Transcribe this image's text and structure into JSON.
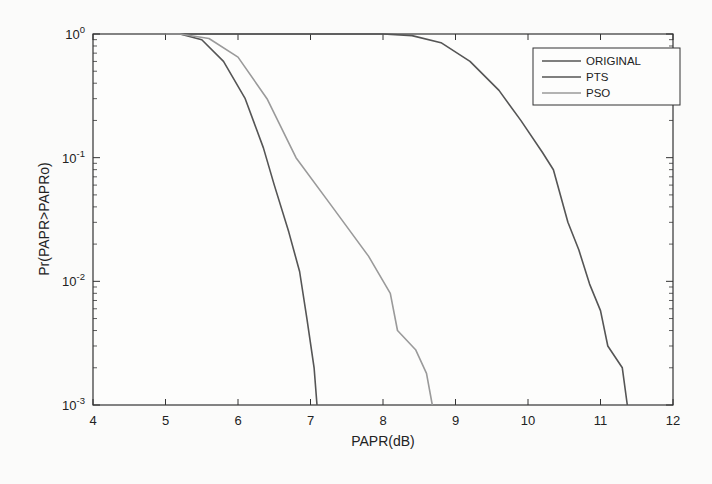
{
  "chart_data": {
    "type": "line",
    "title": "",
    "xlabel": "PAPR(dB)",
    "ylabel": "Pr(PAPR>PAPRo)",
    "xlim": [
      4,
      12
    ],
    "ylim": [
      0.001,
      1
    ],
    "yscale": "log",
    "grid": false,
    "legend_position": "upper right",
    "x_ticks": [
      "4",
      "5",
      "6",
      "7",
      "8",
      "9",
      "10",
      "11",
      "12"
    ],
    "y_ticks": [
      {
        "base": "10",
        "exp": "0"
      },
      {
        "base": "10",
        "exp": "-1"
      },
      {
        "base": "10",
        "exp": "-2"
      },
      {
        "base": "10",
        "exp": "-3"
      }
    ],
    "series": [
      {
        "name": "ORIGINAL",
        "color": "#555555",
        "x": [
          8.0,
          8.4,
          8.8,
          9.2,
          9.6,
          9.9,
          10.2,
          10.35,
          10.55,
          10.7,
          10.85,
          11.0,
          11.1,
          11.3,
          11.37
        ],
        "y": [
          1.0,
          0.97,
          0.85,
          0.6,
          0.35,
          0.2,
          0.11,
          0.08,
          0.03,
          0.018,
          0.0095,
          0.0058,
          0.003,
          0.002,
          0.001
        ]
      },
      {
        "name": "PTS",
        "color": "#555555",
        "x": [
          5.2,
          5.5,
          5.8,
          6.1,
          6.35,
          6.5,
          6.7,
          6.85,
          6.95,
          7.05,
          7.09
        ],
        "y": [
          1.0,
          0.9,
          0.6,
          0.3,
          0.12,
          0.06,
          0.025,
          0.012,
          0.005,
          0.002,
          0.001
        ]
      },
      {
        "name": "PSO",
        "color": "#9a9a9a",
        "x": [
          5.2,
          5.6,
          6.0,
          6.4,
          6.8,
          7.3,
          7.8,
          8.1,
          8.2,
          8.45,
          8.6,
          8.68
        ],
        "y": [
          1.0,
          0.92,
          0.65,
          0.3,
          0.1,
          0.04,
          0.016,
          0.008,
          0.004,
          0.0028,
          0.0018,
          0.001
        ]
      }
    ]
  },
  "legend": {
    "items": [
      {
        "label": "ORIGINAL",
        "color": "#555555"
      },
      {
        "label": "PTS",
        "color": "#555555"
      },
      {
        "label": "PSO",
        "color": "#9a9a9a"
      }
    ]
  }
}
